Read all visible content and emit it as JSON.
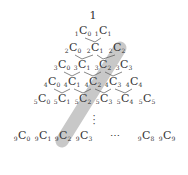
{
  "diagram": {
    "title_apex": "1",
    "rows": [
      {
        "n": 1,
        "terms": [
          {
            "n": "1",
            "r": "0",
            "x": 83,
            "y": 32
          },
          {
            "n": "1",
            "r": "1",
            "x": 103,
            "y": 32
          }
        ]
      },
      {
        "n": 2,
        "terms": [
          {
            "n": "2",
            "r": "0",
            "x": 73,
            "y": 49
          },
          {
            "n": "2",
            "r": "1",
            "x": 95,
            "y": 49
          },
          {
            "n": "2",
            "r": "2",
            "x": 117,
            "y": 49
          }
        ]
      },
      {
        "n": 3,
        "terms": [
          {
            "n": "3",
            "r": "0",
            "x": 62,
            "y": 66
          },
          {
            "n": "3",
            "r": "1",
            "x": 82,
            "y": 66
          },
          {
            "n": "3",
            "r": "2",
            "x": 103,
            "y": 66
          },
          {
            "n": "3",
            "r": "3",
            "x": 124,
            "y": 66
          }
        ]
      },
      {
        "n": 4,
        "terms": [
          {
            "n": "4",
            "r": "0",
            "x": 52,
            "y": 83
          },
          {
            "n": "4",
            "r": "1",
            "x": 72,
            "y": 83
          },
          {
            "n": "4",
            "r": "2",
            "x": 93,
            "y": 83
          },
          {
            "n": "4",
            "r": "3",
            "x": 113,
            "y": 83
          },
          {
            "n": "4",
            "r": "4",
            "x": 134,
            "y": 83
          }
        ]
      },
      {
        "n": 5,
        "terms": [
          {
            "n": "5",
            "r": "0",
            "x": 42,
            "y": 100
          },
          {
            "n": "5",
            "r": "1",
            "x": 62,
            "y": 100
          },
          {
            "n": "5",
            "r": "2",
            "x": 83,
            "y": 100
          },
          {
            "n": "5",
            "r": "3",
            "x": 104,
            "y": 100
          },
          {
            "n": "5",
            "r": "4",
            "x": 125,
            "y": 100
          },
          {
            "n": "5",
            "r": "5",
            "x": 147,
            "y": 100
          }
        ]
      },
      {
        "n": 9,
        "terms": [
          {
            "n": "9",
            "r": "0",
            "x": 22,
            "y": 137
          },
          {
            "n": "9",
            "r": "1",
            "x": 43,
            "y": 137
          },
          {
            "n": "9",
            "r": "2",
            "x": 63,
            "y": 137
          },
          {
            "n": "9",
            "r": "3",
            "x": 84,
            "y": 137
          },
          {
            "n": "9",
            "r": "8",
            "x": 146,
            "y": 137
          },
          {
            "n": "9",
            "r": "9",
            "x": 167,
            "y": 137
          }
        ]
      }
    ],
    "vertical_ellipsis": "⋮",
    "horizontal_ellipsis": "⋯",
    "highlight": {
      "label": "diagonal r=2",
      "color": "#c8c8c8",
      "from": "2C2",
      "to": "9C2"
    },
    "line_color": "#555555"
  }
}
